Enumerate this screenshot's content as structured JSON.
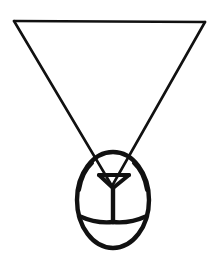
{
  "image": {
    "title": "Line drawing of a pendant medallion",
    "subject": "inverted-triangle-pendant",
    "style": "black ink line art on white background",
    "background_color": "#ffffff",
    "stroke_color": "#111111",
    "caption": ""
  },
  "canvas": {
    "width": 213,
    "height": 264
  },
  "shapes": {
    "triangle": {
      "name": "inverted-triangle-bail",
      "top_left": {
        "x": 14,
        "y": 21
      },
      "top_right": {
        "x": 205,
        "y": 22
      },
      "apex": {
        "x": 112,
        "y": 186
      },
      "stroke_width": 2.6,
      "top_bar_path": "M 14 21 L 205 22",
      "left_leg_path": "M 14 21 L 112 186",
      "right_leg_path": "M 205 22 L 112 186"
    },
    "oval": {
      "name": "oval-body",
      "center": {
        "x": 113,
        "y": 200
      },
      "radius_x": 36,
      "radius_y": 48,
      "stroke_width": 4.4,
      "top": {
        "x": 113,
        "y": 152
      },
      "bottom": {
        "x": 113,
        "y": 248
      },
      "left": {
        "x": 77,
        "y": 200
      },
      "right": {
        "x": 149,
        "y": 200
      }
    },
    "inner_triangle": {
      "name": "inner-small-triangle",
      "left": {
        "x": 99,
        "y": 175
      },
      "right": {
        "x": 129,
        "y": 175
      },
      "bottom": {
        "x": 113,
        "y": 188
      },
      "stroke_width": 4.0,
      "bar_path": "M 99 175 L 129 175"
    },
    "stem": {
      "name": "vertical-stem",
      "top": {
        "x": 113,
        "y": 188
      },
      "bottom": {
        "x": 113,
        "y": 222
      },
      "stroke_width": 4.4
    },
    "lower_arc": {
      "name": "lower-arc",
      "left_end": {
        "x": 79,
        "y": 216
      },
      "right_end": {
        "x": 147,
        "y": 216
      },
      "junction": {
        "x": 113,
        "y": 222
      },
      "stroke_width": 4.4,
      "left_path": "M 79 216 Q 97 224 113 222",
      "right_path": "M 147 216 Q 129 224 113 222"
    },
    "shoulder_curves": {
      "name": "shoulder-curves",
      "left_path": "M 92 163 Q 82 172 79 190",
      "right_path": "M 134 163 Q 144 172 147 190",
      "stroke_width": 4.0
    }
  }
}
